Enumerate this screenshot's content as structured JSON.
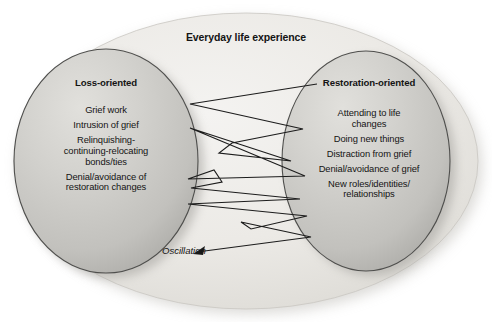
{
  "diagram": {
    "title": "Everyday life experience",
    "type": "dual-process-model-of-coping-with-bereavement",
    "outer_region_name": "Everyday life experience",
    "oscillation_label": "Oscillation",
    "left_ellipse": {
      "title": "Loss-oriented",
      "items": [
        "Grief work",
        "Intrusion of grief",
        "Relinquishing-\ncontinuing-relocating\nbonds/ties",
        "Denial/avoidance of\nrestoration changes"
      ]
    },
    "right_ellipse": {
      "title": "Restoration-oriented",
      "items": [
        "Attending to life\nchanges",
        "Doing new things",
        "Distraction from grief",
        "Denial/avoidance of grief",
        "New roles/identities/\nrelationships"
      ]
    },
    "colors": {
      "outer_fill": "#e9e8e4",
      "ellipse_fill": "#c9c8c4",
      "ellipse_stroke": "#4a4a4a",
      "zigzag_stroke": "#1a1a1a",
      "text": "#141414",
      "page_background": "#ffffff"
    },
    "oscillation_path": {
      "description": "zigzag line oscillating between the loss-oriented and restoration-oriented ellipses, terminating in an arrow pointing to the Oscillation label",
      "points": [
        [
          317,
          84
        ],
        [
          190,
          104
        ],
        [
          303,
          129
        ],
        [
          232,
          143
        ],
        [
          219,
          153
        ],
        [
          291,
          161
        ],
        [
          190,
          128
        ],
        [
          305,
          176
        ],
        [
          188,
          179
        ],
        [
          214,
          170
        ],
        [
          222,
          182
        ],
        [
          191,
          188
        ],
        [
          300,
          199
        ],
        [
          188,
          204
        ],
        [
          307,
          216
        ],
        [
          251,
          229
        ],
        [
          241,
          222
        ],
        [
          311,
          237
        ],
        [
          195,
          253
        ]
      ],
      "arrow_at": [
        195,
        253
      ]
    }
  }
}
